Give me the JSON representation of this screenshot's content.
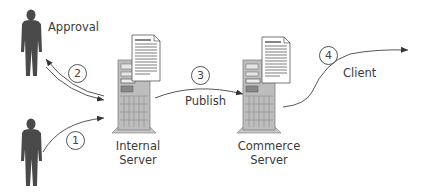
{
  "diagram": {
    "type": "publishing-workflow",
    "actors": [
      {
        "id": "approver",
        "label": "Approval",
        "icon": "person-icon"
      },
      {
        "id": "author",
        "label": "",
        "icon": "person-icon"
      }
    ],
    "servers": [
      {
        "id": "internal",
        "label_line1": "Internal",
        "label_line2": "Server",
        "icon": "server-tower-icon",
        "doc_icon": "document-icon"
      },
      {
        "id": "commerce",
        "label_line1": "Commerce",
        "label_line2": "Server",
        "icon": "server-tower-icon",
        "doc_icon": "document-icon"
      }
    ],
    "steps": [
      {
        "number": "1",
        "from": "author",
        "to": "internal",
        "label": ""
      },
      {
        "number": "2",
        "from": "internal",
        "to": "approver",
        "label": "",
        "bidirectional": true
      },
      {
        "number": "3",
        "from": "internal",
        "to": "commerce",
        "label": "Publish"
      },
      {
        "number": "4",
        "from": "commerce",
        "to": "client",
        "label": "Client"
      }
    ],
    "colors": {
      "person": "#4a4a4a",
      "server_body": "#bdbdbd",
      "line": "#444444",
      "text": "#3a3a3a",
      "background": "#ffffff"
    }
  }
}
